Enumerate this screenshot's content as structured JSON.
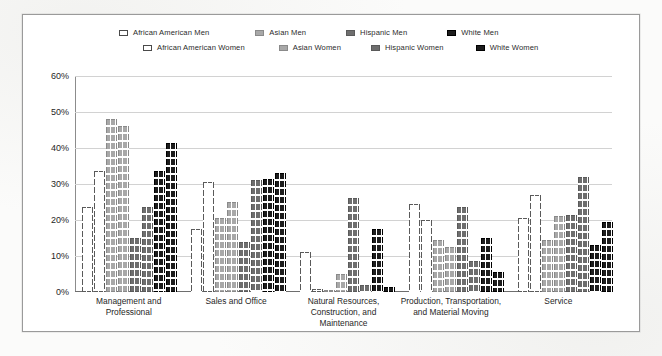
{
  "chart_data": {
    "type": "bar",
    "title": "",
    "subtitle": "",
    "xlabel": "",
    "ylabel": "",
    "ylim": [
      0,
      60
    ],
    "ytick_labels": [
      "0%",
      "10%",
      "20%",
      "30%",
      "40%",
      "50%",
      "60%"
    ],
    "ytick_values": [
      0,
      10,
      20,
      30,
      40,
      50,
      60
    ],
    "grid": true,
    "legend_position": "top",
    "categories": [
      "Management and Professional",
      "Sales and Office",
      "Natural Resources, Construction, and Maintenance",
      "Production, Transportation, and Material Moving",
      "Service"
    ],
    "series": [
      {
        "name": "African American Men",
        "color": "#ffffff",
        "border": "#5a5a5a",
        "values": [
          23.5,
          17.5,
          11.0,
          24.5,
          20.5
        ]
      },
      {
        "name": "African American Women",
        "color": "#ffffff",
        "border": "#5a5a5a",
        "values": [
          33.5,
          30.5,
          0.8,
          20.0,
          27.0
        ]
      },
      {
        "name": "Asian Men",
        "color": "#a8a8a8",
        "border": "#8a8a8a",
        "values": [
          48.0,
          20.5,
          0.5,
          14.5,
          14.5
        ]
      },
      {
        "name": "Asian Women",
        "color": "#a8a8a8",
        "border": "#8a8a8a",
        "values": [
          46.0,
          25.0,
          5.0,
          12.5,
          21.0
        ]
      },
      {
        "name": "Hispanic Men",
        "color": "#6e6e6e",
        "border": "#5a5a5a",
        "values": [
          15.0,
          14.0,
          26.0,
          23.5,
          21.5
        ]
      },
      {
        "name": "Hispanic Women",
        "color": "#6e6e6e",
        "border": "#5a5a5a",
        "values": [
          23.5,
          31.0,
          2.0,
          8.5,
          32.0
        ]
      },
      {
        "name": "White Men",
        "color": "#1c1c1c",
        "border": "#000000",
        "values": [
          33.5,
          31.5,
          17.5,
          15.0,
          13.0
        ]
      },
      {
        "name": "White Women",
        "color": "#1c1c1c",
        "border": "#000000",
        "values": [
          41.5,
          33.0,
          1.5,
          5.5,
          19.5
        ]
      }
    ]
  },
  "legend": {
    "row1": [
      {
        "label": "African American Men",
        "swatch": "swatch-white-outline"
      },
      {
        "label": "Asian Men",
        "swatch": "swatch-light-gray"
      },
      {
        "label": "Hispanic Men",
        "swatch": "swatch-dark-gray"
      },
      {
        "label": "White Men",
        "swatch": "swatch-black"
      }
    ],
    "row2": [
      {
        "label": "African American Women",
        "swatch": "swatch-white-outline"
      },
      {
        "label": "Asian Women",
        "swatch": "swatch-light-gray"
      },
      {
        "label": "Hispanic Women",
        "swatch": "swatch-dark-gray"
      },
      {
        "label": "White Women",
        "swatch": "swatch-black"
      }
    ]
  }
}
